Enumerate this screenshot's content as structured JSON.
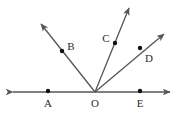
{
  "figure": {
    "type": "geometry-diagram",
    "width": 175,
    "height": 115,
    "background_color": "#ffffff",
    "stroke_color": "#555555",
    "dot_color": "#111111",
    "label_color": "#2b2b2b",
    "stroke_width": 1.3,
    "dot_radius": 2.2,
    "vertex": {
      "name": "O",
      "x": 95,
      "y": 92
    },
    "baseline": {
      "name": "line-AE",
      "x1": 13,
      "y1": 92,
      "x2": 170,
      "y2": 92,
      "arrow_start": true,
      "arrow_end": true
    },
    "rays": [
      {
        "name": "ray-OB",
        "through_label": "B",
        "x1": 95,
        "y1": 92,
        "x2": 41,
        "y2": 24,
        "arrow_end": true
      },
      {
        "name": "ray-OC",
        "through_label": "C",
        "x1": 95,
        "y1": 92,
        "x2": 129,
        "y2": 8,
        "arrow_end": true
      },
      {
        "name": "ray-OD",
        "through_label": "D",
        "x1": 95,
        "y1": 92,
        "x2": 164,
        "y2": 34,
        "arrow_end": true
      }
    ],
    "points": [
      {
        "name": "point-A",
        "label": "A",
        "x": 48,
        "y": 91,
        "label_x": 48,
        "label_y": 103
      },
      {
        "name": "point-B",
        "label": "B",
        "x": 62,
        "y": 51,
        "label_x": 71,
        "label_y": 46
      },
      {
        "name": "point-C",
        "label": "C",
        "x": 115,
        "y": 43,
        "label_x": 106,
        "label_y": 38
      },
      {
        "name": "point-D",
        "label": "D",
        "x": 140,
        "y": 48,
        "label_x": 149,
        "label_y": 58
      },
      {
        "name": "point-E",
        "label": "E",
        "x": 140,
        "y": 91,
        "label_x": 140,
        "label_y": 103
      },
      {
        "name": "point-O",
        "label": "O",
        "x": 95,
        "y": 92,
        "label_x": 95,
        "label_y": 103
      }
    ]
  }
}
